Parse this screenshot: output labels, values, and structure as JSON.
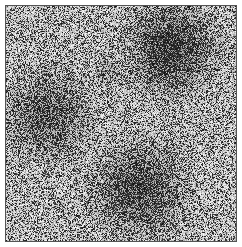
{
  "image": {
    "description": "Grayscale noisy micrograph-like texture with dark diffuse blobs",
    "background_gray": "#c4c4c4",
    "border_color": "#555555",
    "blobs": [
      {
        "cx": 0.72,
        "cy": 0.18,
        "r": 0.17,
        "strength": 0.75
      },
      {
        "cx": 0.18,
        "cy": 0.47,
        "r": 0.17,
        "strength": 0.55
      },
      {
        "cx": 0.58,
        "cy": 0.78,
        "r": 0.18,
        "strength": 0.65
      },
      {
        "cx": 0.45,
        "cy": 0.28,
        "r": 0.06,
        "strength": 0.3
      }
    ],
    "noise_seed": 7,
    "dot_density": 0.32
  }
}
